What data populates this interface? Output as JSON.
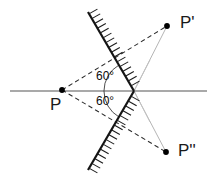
{
  "figure": {
    "width": 217,
    "height": 174,
    "background": "#ffffff"
  },
  "labels": {
    "point_source": "P",
    "image_first": "P'",
    "image_second": "P''",
    "angle_top": "60°",
    "angle_bottom": "60°"
  },
  "colors": {
    "axis_line": "#8c8c8c",
    "mirror": "#1a1a1a",
    "hatch": "#1a1a1a",
    "dashed_ray": "#2b2b2b",
    "thin_ray": "#b0b0b0",
    "point_marker": "#000000",
    "text": "#1a1a1a"
  },
  "geometry": {
    "axis": {
      "x1": 10,
      "y1": 91,
      "x2": 207,
      "y2": 91
    },
    "mirror_vertex": {
      "x": 134,
      "y": 91
    },
    "mirror_top_end": {
      "x": 88,
      "y": 12
    },
    "mirror_bottom_end": {
      "x": 88,
      "y": 170
    },
    "points": [
      {
        "name": "P",
        "x": 62,
        "y": 90
      },
      {
        "name": "P'",
        "x": 167,
        "y": 26
      },
      {
        "name": "P''",
        "x": 166,
        "y": 152
      }
    ],
    "dashed_rays": [
      {
        "from": "P",
        "to": "P'"
      },
      {
        "from": "P",
        "to": "P''"
      }
    ],
    "thin_rays": [
      {
        "from": "mirror_vertex",
        "to": "P'"
      },
      {
        "from": "mirror_vertex",
        "to": "P''"
      }
    ],
    "angle_arc": {
      "center": {
        "x": 134,
        "y": 91
      },
      "radius": 30,
      "start_deg": 120,
      "end_deg": 240
    }
  }
}
